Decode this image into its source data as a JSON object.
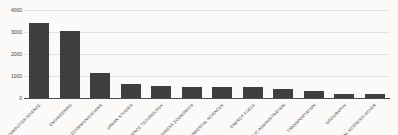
{
  "chart_data": {
    "type": "bar",
    "title": "",
    "xlabel": "",
    "ylabel": "",
    "categories": [
      "COMPUTER SCIENCE",
      "ENGINEERING",
      "TELECOMMUNICATIONS",
      "URBAN STUDIES",
      "SCIENCE TECHNOLOGY",
      "BUSINESS ECONOMICS",
      "ENVIRONMENTAL SCIENCES",
      "ENERGY FUELS",
      "PUBLIC ADMINISTRATION",
      "TRANSPORTATION",
      "GEOGRAPHY",
      "SOCIAL SCIENCES OTHER"
    ],
    "values": [
      3400,
      3050,
      1150,
      650,
      550,
      500,
      500,
      480,
      390,
      310,
      180,
      170
    ],
    "ylim": [
      0,
      4000
    ],
    "yticks": [
      0,
      1000,
      2000,
      3000,
      4000
    ],
    "grid": "horizontal",
    "legend": "none",
    "colors": {
      "bar": "#3e3e3e",
      "background": "#fbfaf8",
      "gridline": "#e3e2df",
      "axis_line": "#4a4a4a",
      "tick_label": "#3a3a3a"
    }
  }
}
